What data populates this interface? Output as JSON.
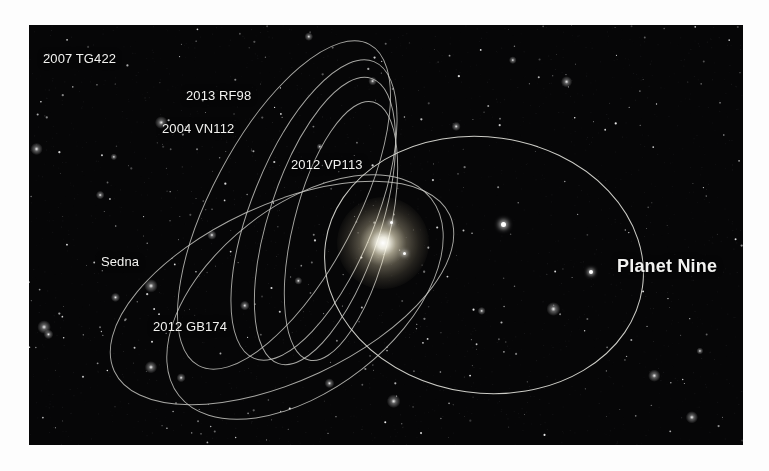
{
  "figure": {
    "background_color": "#fdfdfd",
    "panel_color": "#060607",
    "orbit_color": "#dcdcd6",
    "label_color": "#f2f2f0"
  },
  "labels": [
    {
      "id": "2007-tg422",
      "text": "2007 TG422",
      "x": 43,
      "y": 52,
      "style": "normal"
    },
    {
      "id": "2013-rf98",
      "text": "2013 RF98",
      "x": 186,
      "y": 89,
      "style": "normal"
    },
    {
      "id": "2004-vn112",
      "text": "2004 VN112",
      "x": 162,
      "y": 122,
      "style": "normal"
    },
    {
      "id": "2012-vp113",
      "text": "2012 VP113",
      "x": 291,
      "y": 158,
      "style": "normal"
    },
    {
      "id": "sedna",
      "text": "Sedna",
      "x": 101,
      "y": 255,
      "style": "normal"
    },
    {
      "id": "2012-gb174",
      "text": "2012 GB174",
      "x": 153,
      "y": 320,
      "style": "normal"
    },
    {
      "id": "planet-nine",
      "text": "Planet Nine",
      "x": 617,
      "y": 259,
      "style": "big"
    }
  ],
  "objects": [
    {
      "id": "sun",
      "name": "Sun",
      "x": 383,
      "y": 243,
      "glow_radius": 46
    },
    {
      "id": "planet-nine-body",
      "name": "Planet Nine",
      "x": 591,
      "y": 272,
      "size": 4
    },
    {
      "id": "inner-body-a",
      "name": "inner object",
      "x": 391,
      "y": 222,
      "size": 3
    },
    {
      "id": "inner-body-b",
      "name": "inner object",
      "x": 404,
      "y": 253,
      "size": 3
    },
    {
      "id": "field-star",
      "name": "background star",
      "x": 503,
      "y": 224,
      "size": 5
    }
  ],
  "orbits": [
    {
      "id": "2007-tg422",
      "label": "2007 TG422",
      "cx": 255,
      "cy": 180,
      "rx": 72,
      "ry": 182,
      "rotation": 28
    },
    {
      "id": "2013-rf98",
      "label": "2013 RF98",
      "cx": 285,
      "cy": 185,
      "rx": 62,
      "ry": 160,
      "rotation": 22
    },
    {
      "id": "2004-vn112",
      "label": "2004 VN112",
      "cx": 296,
      "cy": 196,
      "rx": 56,
      "ry": 150,
      "rotation": 18
    },
    {
      "id": "2012-vp113",
      "label": "2012 VP113",
      "cx": 312,
      "cy": 206,
      "rx": 48,
      "ry": 133,
      "rotation": 14
    },
    {
      "id": "sedna",
      "label": "Sedna",
      "cx": 253,
      "cy": 268,
      "rx": 88,
      "ry": 185,
      "rotation": 65
    },
    {
      "id": "2012-gb174",
      "label": "2012 GB174",
      "cx": 276,
      "cy": 272,
      "rx": 92,
      "ry": 160,
      "rotation": 52
    },
    {
      "id": "planet-nine",
      "label": "Planet Nine",
      "cx": 455,
      "cy": 240,
      "rx": 160,
      "ry": 128,
      "rotation": 8
    }
  ],
  "chart_data": {
    "type": "scatter",
    "series": [
      {
        "name": "2007 TG422",
        "kind": "orbit-ellipse"
      },
      {
        "name": "2013 RF98",
        "kind": "orbit-ellipse"
      },
      {
        "name": "2004 VN112",
        "kind": "orbit-ellipse"
      },
      {
        "name": "2012 VP113",
        "kind": "orbit-ellipse"
      },
      {
        "name": "Sedna",
        "kind": "orbit-ellipse"
      },
      {
        "name": "2012 GB174",
        "kind": "orbit-ellipse"
      },
      {
        "name": "Planet Nine",
        "kind": "orbit-ellipse"
      }
    ],
    "annotations": [
      "Sun at shared perihelion focus",
      "Planet Nine marked by body dot on its orbit"
    ],
    "grid": false,
    "legend": "inline-labels"
  },
  "starfield": {
    "seed": 20160120,
    "count": 420
  }
}
